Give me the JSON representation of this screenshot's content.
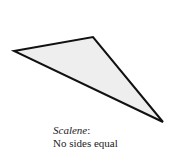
{
  "diagram": {
    "shape": "scalene-triangle",
    "vertices": [
      [
        14,
        51
      ],
      [
        93,
        37
      ],
      [
        163,
        122
      ]
    ],
    "fill_color": "#eeeeee",
    "stroke_color": "#111111"
  },
  "caption": {
    "term": "Scalene",
    "punct": ":",
    "description": "No sides equal"
  }
}
